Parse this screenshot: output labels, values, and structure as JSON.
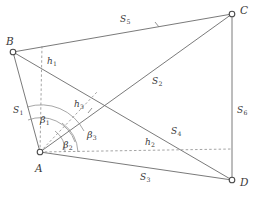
{
  "figure": {
    "type": "geometry-diagram",
    "stroke_color": "#6b6b6b",
    "dash_color": "#8d8d8d",
    "label_color": "#3a3a3a",
    "background": "#ffffff"
  },
  "vertices": [
    {
      "name": "B",
      "label": "B",
      "x": 13,
      "y": 52,
      "label_x": 6,
      "label_y": 36
    },
    {
      "name": "C",
      "label": "C",
      "x": 232,
      "y": 14,
      "label_x": 240,
      "label_y": 5
    },
    {
      "name": "A",
      "label": "A",
      "x": 40,
      "y": 152,
      "label_x": 35,
      "label_y": 163
    },
    {
      "name": "D",
      "label": "D",
      "x": 232,
      "y": 180,
      "label_x": 240,
      "label_y": 177
    }
  ],
  "side_labels": [
    {
      "name": "S1",
      "base": "S",
      "sub": "1",
      "x": 13,
      "y": 106
    },
    {
      "name": "S2",
      "base": "S",
      "sub": "2",
      "x": 152,
      "y": 77
    },
    {
      "name": "S3",
      "base": "S",
      "sub": "3",
      "x": 140,
      "y": 173
    },
    {
      "name": "S4",
      "base": "S",
      "sub": "4",
      "x": 171,
      "y": 127
    },
    {
      "name": "S5",
      "base": "S",
      "sub": "5",
      "x": 120,
      "y": 15
    },
    {
      "name": "S6",
      "base": "S",
      "sub": "6",
      "x": 237,
      "y": 106
    }
  ],
  "height_labels": [
    {
      "name": "h1",
      "base": "h",
      "sub": "1",
      "x": 47,
      "y": 57
    },
    {
      "name": "h2",
      "base": "h",
      "sub": "2",
      "x": 145,
      "y": 138
    },
    {
      "name": "h3",
      "base": "h",
      "sub": "3",
      "x": 74,
      "y": 100
    }
  ],
  "angle_labels": [
    {
      "name": "beta1",
      "base": "β",
      "sub": "1",
      "x": 40,
      "y": 115
    },
    {
      "name": "beta2",
      "base": "β",
      "sub": "2",
      "x": 63,
      "y": 140
    },
    {
      "name": "beta3",
      "base": "β",
      "sub": "3",
      "x": 87,
      "y": 130
    }
  ]
}
